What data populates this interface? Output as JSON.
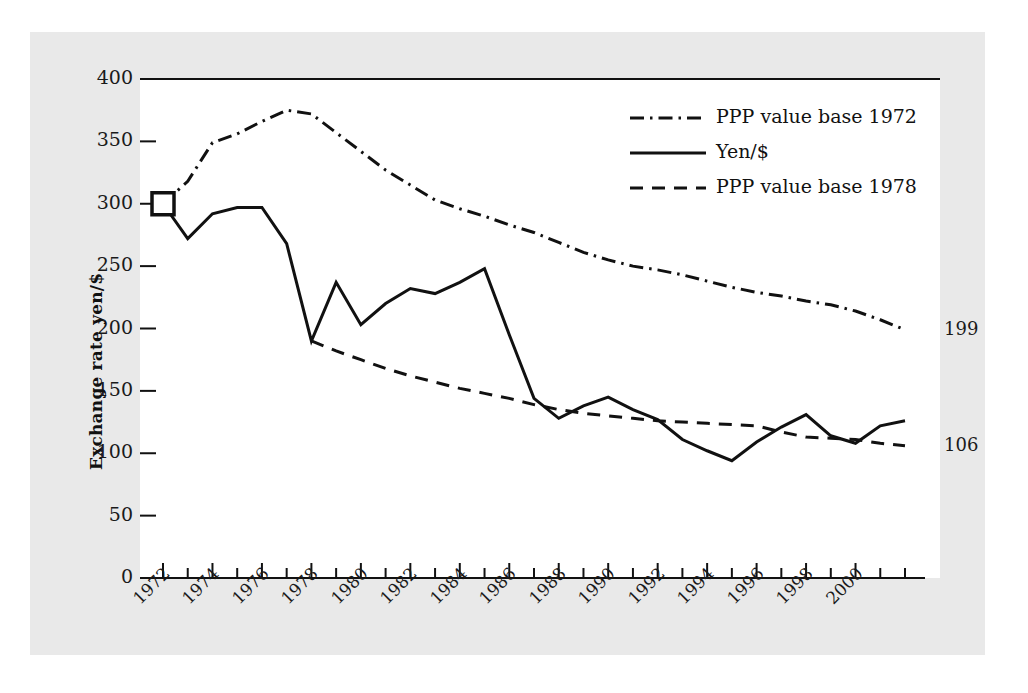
{
  "chart_data": {
    "type": "line",
    "title": "",
    "xlabel": "",
    "ylabel": "Exchange rate yen/$",
    "xlim": [
      1972,
      2002
    ],
    "ylim": [
      0,
      400
    ],
    "grid": false,
    "legend_position": "top-right",
    "y_ticks": [
      0,
      50,
      100,
      150,
      200,
      250,
      300,
      350,
      400
    ],
    "y_tick_labels": [
      "0",
      "50",
      "100",
      "150",
      "200",
      "250",
      "300",
      "350",
      "400"
    ],
    "x_ticks": [
      1972,
      1973,
      1974,
      1975,
      1976,
      1977,
      1978,
      1979,
      1980,
      1981,
      1982,
      1983,
      1984,
      1985,
      1986,
      1987,
      1988,
      1989,
      1990,
      1991,
      1992,
      1993,
      1994,
      1995,
      1996,
      1997,
      1998,
      1999,
      2000,
      2001,
      2002
    ],
    "x_tick_labels": [
      "1972",
      "1974",
      "1976",
      "1978",
      "1980",
      "1982",
      "1984",
      "1986",
      "1988",
      "1990",
      "1992",
      "1994",
      "1996",
      "1998",
      "2000"
    ],
    "x_labeled_years": [
      1972,
      1974,
      1976,
      1978,
      1980,
      1982,
      1984,
      1986,
      1988,
      1990,
      1992,
      1994,
      1996,
      1998,
      2000
    ],
    "x": [
      1972,
      1973,
      1974,
      1975,
      1976,
      1977,
      1978,
      1979,
      1980,
      1981,
      1982,
      1983,
      1984,
      1985,
      1986,
      1987,
      1988,
      1989,
      1990,
      1991,
      1992,
      1993,
      1994,
      1995,
      1996,
      1997,
      1998,
      1999,
      2000,
      2001,
      2002
    ],
    "series": [
      {
        "name": "PPP value base 1972",
        "style": "dash-dot",
        "color": "#111111",
        "x": [
          1972,
          1973,
          1974,
          1975,
          1976,
          1977,
          1978,
          1979,
          1980,
          1981,
          1982,
          1983,
          1984,
          1985,
          1986,
          1987,
          1988,
          1989,
          1990,
          1991,
          1992,
          1993,
          1994,
          1995,
          1996,
          1997,
          1998,
          1999,
          2000,
          2001,
          2002
        ],
        "values": [
          300,
          318,
          349,
          356,
          366,
          375,
          372,
          357,
          342,
          327,
          315,
          303,
          296,
          290,
          283,
          277,
          269,
          261,
          255,
          250,
          247,
          243,
          238,
          233,
          229,
          226,
          222,
          219,
          214,
          207,
          199
        ],
        "end_label": "199"
      },
      {
        "name": "Yen/$",
        "style": "solid",
        "color": "#111111",
        "x": [
          1972,
          1973,
          1974,
          1975,
          1976,
          1977,
          1978,
          1979,
          1980,
          1981,
          1982,
          1983,
          1984,
          1985,
          1986,
          1987,
          1988,
          1989,
          1990,
          1991,
          1992,
          1993,
          1994,
          1995,
          1996,
          1997,
          1998,
          1999,
          2000,
          2001,
          2002
        ],
        "values": [
          300,
          272,
          292,
          297,
          297,
          268,
          190,
          237,
          203,
          220,
          232,
          228,
          237,
          248,
          195,
          144,
          128,
          138,
          145,
          135,
          127,
          111,
          102,
          94,
          109,
          121,
          131,
          114,
          108,
          122,
          126
        ],
        "marker_start": {
          "year": 1972,
          "value": 300,
          "shape": "square"
        }
      },
      {
        "name": "PPP value base 1978",
        "style": "dashed",
        "color": "#111111",
        "x": [
          1978,
          1979,
          1980,
          1981,
          1982,
          1983,
          1984,
          1985,
          1986,
          1987,
          1988,
          1989,
          1990,
          1991,
          1992,
          1993,
          1994,
          1995,
          1996,
          1997,
          1998,
          1999,
          2000,
          2001,
          2002
        ],
        "values": [
          190,
          182,
          175,
          168,
          162,
          157,
          152,
          148,
          144,
          139,
          135,
          132,
          130,
          128,
          126,
          125,
          124,
          123,
          122,
          117,
          113,
          112,
          111,
          108,
          106
        ],
        "end_label": "106"
      }
    ],
    "end_labels": [
      {
        "text": "199",
        "value": 199
      },
      {
        "text": "106",
        "value": 106
      }
    ]
  },
  "legend": {
    "items": [
      {
        "label": "PPP value base 1972",
        "style": "dash-dot"
      },
      {
        "label": "Yen/$",
        "style": "solid"
      },
      {
        "label": "PPP value base 1978",
        "style": "dashed"
      }
    ]
  }
}
